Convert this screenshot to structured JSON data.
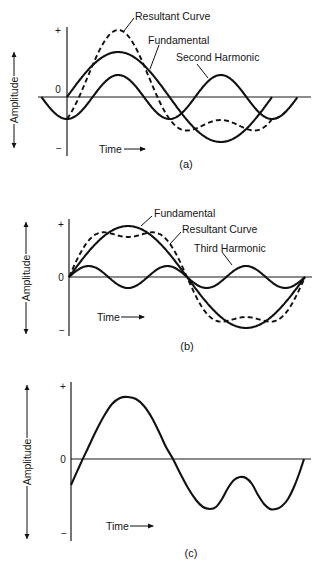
{
  "common": {
    "ylabel": "Amplitude",
    "xlabel": "Time",
    "tick_plus": "+",
    "tick_zero": "0",
    "tick_minus": "−"
  },
  "panels": [
    {
      "caption": "(a)",
      "labels": [
        "Resultant Curve",
        "Fundamental",
        "Second Harmonic"
      ]
    },
    {
      "caption": "(b)",
      "labels": [
        "Fundamental",
        "Resultant Curve",
        "Third Harmonic"
      ]
    },
    {
      "caption": "(c)",
      "labels": []
    }
  ],
  "chart_data": [
    {
      "type": "line",
      "title": "(a)",
      "xlabel": "Time",
      "ylabel": "Amplitude",
      "y_ticks": [
        "+",
        "0",
        "−"
      ],
      "grid": false,
      "series": [
        {
          "name": "Fundamental",
          "style": "solid",
          "function": "sin",
          "relative_amplitude": 1.0,
          "cycles": 1,
          "phase_deg": 0
        },
        {
          "name": "Second Harmonic",
          "style": "solid",
          "function": "sin",
          "relative_amplitude": 0.49,
          "cycles": 2,
          "phase_deg": -90,
          "note": "starts before fundamental; trough at fundamental origin"
        },
        {
          "name": "Resultant Curve",
          "style": "dashed",
          "function": "Fundamental + Second Harmonic"
        }
      ]
    },
    {
      "type": "line",
      "title": "(b)",
      "xlabel": "Time",
      "ylabel": "Amplitude",
      "y_ticks": [
        "+",
        "0",
        "−"
      ],
      "grid": false,
      "series": [
        {
          "name": "Fundamental",
          "style": "solid",
          "function": "sin",
          "relative_amplitude": 1.0,
          "cycles": 1,
          "phase_deg": 0
        },
        {
          "name": "Third Harmonic",
          "style": "solid",
          "function": "sin",
          "relative_amplitude": 0.21,
          "cycles": 3,
          "phase_deg": 0
        },
        {
          "name": "Resultant Curve",
          "style": "dashed",
          "function": "Fundamental + Third Harmonic"
        }
      ]
    },
    {
      "type": "line",
      "title": "(c)",
      "xlabel": "Time",
      "ylabel": "Amplitude",
      "y_ticks": [
        "+",
        "0",
        "−"
      ],
      "grid": false,
      "series": [
        {
          "name": "Complex waveform",
          "style": "solid",
          "description": "starts below zero, rises to a single broad positive peak, then a negative half with two troughs separated by a local maximum, returning to zero"
        }
      ]
    }
  ],
  "geometry": {
    "a": {
      "x0": 67,
      "y0": 97,
      "top": 27,
      "bottom": 156,
      "axis_end": 311,
      "period": 205,
      "A1": 45,
      "A2": 22,
      "h2_start": 40,
      "h2_end": 296
    },
    "b": {
      "x0": 69,
      "y0": 277,
      "top": 219,
      "bottom": 336,
      "axis_end": 312,
      "period": 236,
      "A1": 51,
      "A3": 11
    },
    "c": {
      "x0": 71,
      "y0": 459,
      "top": 382,
      "bottom": 541,
      "axis_end": 311,
      "points": [
        [
          71,
          485
        ],
        [
          80,
          465
        ],
        [
          88,
          448
        ],
        [
          96,
          431
        ],
        [
          104,
          416
        ],
        [
          112,
          404
        ],
        [
          120,
          398
        ],
        [
          128,
          397
        ],
        [
          136,
          399
        ],
        [
          144,
          406
        ],
        [
          152,
          418
        ],
        [
          160,
          434
        ],
        [
          166,
          447
        ],
        [
          173,
          459
        ],
        [
          180,
          473
        ],
        [
          188,
          488
        ],
        [
          196,
          500
        ],
        [
          203,
          507
        ],
        [
          210,
          509
        ],
        [
          216,
          507
        ],
        [
          222,
          499
        ],
        [
          228,
          488
        ],
        [
          234,
          480
        ],
        [
          240,
          477
        ],
        [
          246,
          478
        ],
        [
          252,
          484
        ],
        [
          258,
          495
        ],
        [
          264,
          504
        ],
        [
          270,
          509
        ],
        [
          276,
          509
        ],
        [
          282,
          506
        ],
        [
          288,
          499
        ],
        [
          294,
          487
        ],
        [
          299,
          474
        ],
        [
          304,
          459
        ]
      ]
    }
  }
}
